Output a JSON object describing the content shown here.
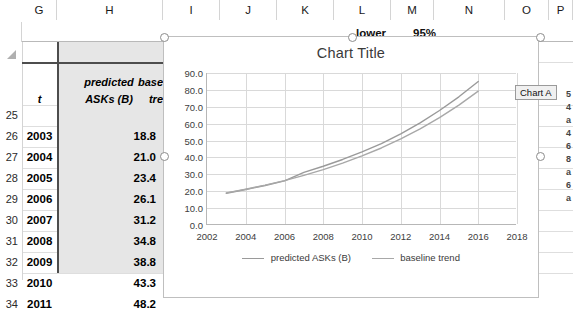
{
  "app": "excel-worksheet-with-chart",
  "sheet": {
    "column_headers": [
      "G",
      "H",
      "I",
      "J",
      "K",
      "L",
      "M",
      "N",
      "O",
      "P"
    ],
    "row_headers": [
      "25",
      "26",
      "27",
      "28",
      "29",
      "30",
      "31",
      "32",
      "33",
      "34"
    ],
    "header_row": {
      "t": "t",
      "predicted_line1": "predicted",
      "predicted_line2": "ASKs (B)",
      "baseline_line1": "base",
      "baseline_line2": "tre"
    },
    "rows": [
      {
        "row": "26",
        "year": "2003",
        "value": "18.8"
      },
      {
        "row": "27",
        "year": "2004",
        "value": "21.0"
      },
      {
        "row": "28",
        "year": "2005",
        "value": "23.4"
      },
      {
        "row": "29",
        "year": "2006",
        "value": "26.1"
      },
      {
        "row": "30",
        "year": "2007",
        "value": "31.2"
      },
      {
        "row": "31",
        "year": "2008",
        "value": "34.8"
      },
      {
        "row": "32",
        "year": "2009",
        "value": "38.8"
      },
      {
        "row": "33",
        "year": "2010",
        "value": "43.3"
      },
      {
        "row": "34",
        "year": "2011",
        "value": "48.2"
      }
    ],
    "background_labels": {
      "lower": "lower",
      "confidence": "95%"
    },
    "clipped_column_values": [
      "5",
      "4",
      "a",
      "4",
      "6",
      "8",
      "a",
      "6",
      "a"
    ]
  },
  "chart_object": {
    "title": "Chart Title",
    "tooltip": "Chart A"
  },
  "chart_data": {
    "type": "line",
    "title": "Chart Title",
    "xlabel": "",
    "ylabel": "",
    "xlim": [
      2002,
      2018
    ],
    "ylim": [
      0,
      90
    ],
    "xticks": [
      "2002",
      "2004",
      "2006",
      "2008",
      "2010",
      "2012",
      "2014",
      "2016",
      "2018"
    ],
    "yticks": [
      "0.0",
      "10.0",
      "20.0",
      "30.0",
      "40.0",
      "50.0",
      "60.0",
      "70.0",
      "80.0",
      "90.0"
    ],
    "grid": true,
    "legend_position": "bottom",
    "x": [
      2003,
      2004,
      2005,
      2006,
      2007,
      2008,
      2009,
      2010,
      2011,
      2012,
      2013,
      2014,
      2015,
      2016
    ],
    "series": [
      {
        "name": "predicted ASKs (B)",
        "color": "#9a9a9a",
        "values": [
          18.8,
          21.0,
          23.4,
          26.1,
          31.2,
          34.8,
          38.8,
          43.3,
          48.2,
          54.0,
          60.5,
          67.8,
          75.9,
          85.0
        ]
      },
      {
        "name": "baseline trend",
        "color": "#a8a8a8",
        "values": [
          19.0,
          21.2,
          23.6,
          26.3,
          29.4,
          32.8,
          36.6,
          40.9,
          45.6,
          51.0,
          56.9,
          63.6,
          71.0,
          79.3
        ]
      }
    ]
  }
}
